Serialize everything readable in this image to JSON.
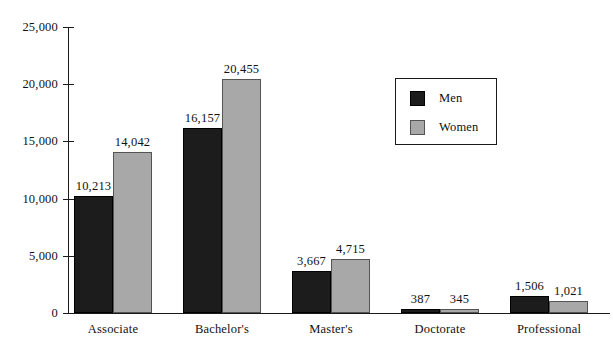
{
  "chart_data": {
    "type": "bar",
    "title": "",
    "subtitle": "",
    "xlabel": "",
    "ylabel": "",
    "categories": [
      "Associate",
      "Bachelor's",
      "Master's",
      "Doctorate",
      "Professional"
    ],
    "series": [
      {
        "name": "Men",
        "color": "#1c1c1c",
        "values": [
          10213,
          16157,
          3667,
          387,
          1506
        ],
        "labels": [
          "10,213",
          "16,157",
          "3,667",
          "387",
          "1,506"
        ]
      },
      {
        "name": "Women",
        "color": "#a8a8a8",
        "values": [
          14042,
          20455,
          4715,
          345,
          1021
        ],
        "labels": [
          "14,042",
          "20,455",
          "4,715",
          "345",
          "1,021"
        ]
      }
    ],
    "ylim": [
      0,
      25000
    ],
    "ytick_values": [
      0,
      5000,
      10000,
      15000,
      20000,
      25000
    ],
    "ytick_labels": [
      "0",
      "5,000",
      "10,000",
      "15,000",
      "20,000",
      "25,000"
    ],
    "grid": false,
    "legend": {
      "position": "upper-right-inside",
      "entries": [
        "Men",
        "Women"
      ]
    }
  }
}
